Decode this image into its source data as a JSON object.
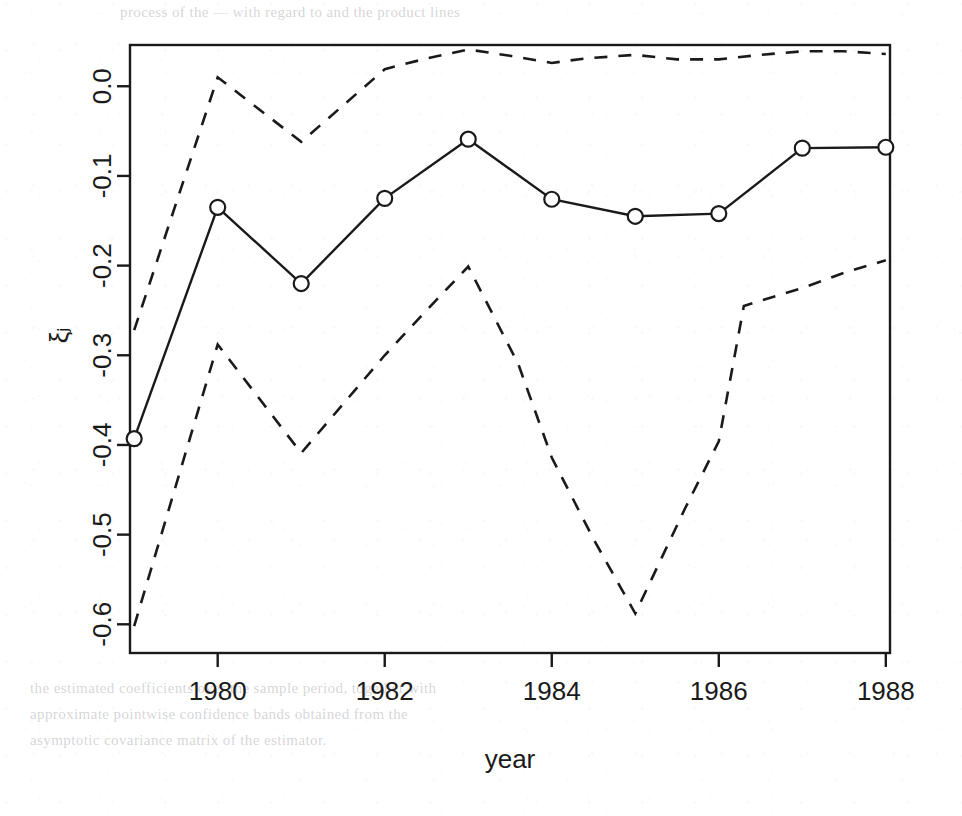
{
  "figure": {
    "background_color": "#ffffff",
    "ink_color": "#1a1a1a",
    "width": 962,
    "height": 816
  },
  "axis": {
    "x_title": "year",
    "y_title": "ξⱼ",
    "x_ticks": [
      "1980",
      "1982",
      "1984",
      "1986",
      "1988"
    ],
    "y_ticks": [
      "0.0",
      "-0.1",
      "-0.2",
      "-0.3",
      "-0.4",
      "-0.5",
      "-0.6"
    ]
  },
  "bleed_through": {
    "top_line": "process of the — with regard to and the product lines",
    "bottom_line_1": "the estimated coefficients over the sample period, together with",
    "bottom_line_2": "approximate pointwise confidence bands obtained from the",
    "bottom_line_3": "asymptotic covariance matrix of the estimator."
  },
  "chart_data": {
    "type": "line",
    "title": "",
    "xlabel": "year",
    "ylabel": "ξⱼ",
    "xlim": [
      1978.95,
      1988.05
    ],
    "ylim": [
      -0.632,
      0.046
    ],
    "grid": false,
    "legend": "none",
    "x": [
      1979,
      1980,
      1981,
      1982,
      1983,
      1984,
      1985,
      1986,
      1987,
      1988
    ],
    "x_tick_values": [
      1980,
      1982,
      1984,
      1986,
      1988
    ],
    "y_tick_values": [
      0.0,
      -0.1,
      -0.2,
      -0.3,
      -0.4,
      -0.5,
      -0.6
    ],
    "series": [
      {
        "name": "estimate",
        "style": "solid",
        "marker": "open-circle",
        "values": [
          -0.393,
          -0.135,
          -0.22,
          -0.125,
          -0.059,
          -0.126,
          -0.145,
          -0.142,
          -0.069,
          -0.068
        ]
      },
      {
        "name": "upper confidence band",
        "style": "dashed",
        "marker": "none",
        "values": [
          -0.272,
          0.01,
          -0.062,
          0.019,
          0.041,
          0.026,
          0.035,
          0.03,
          0.039,
          0.036
        ]
      },
      {
        "name": "lower confidence band",
        "style": "dashed",
        "marker": "none",
        "values": [
          -0.602,
          -0.288,
          -0.409,
          -0.3,
          -0.201,
          -0.414,
          -0.588,
          -0.396,
          -0.225,
          -0.194
        ]
      }
    ],
    "upper_band_dense_x": [
      1979,
      1980,
      1981,
      1982,
      1982.5,
      1983,
      1983.5,
      1984,
      1984.4,
      1985,
      1985.5,
      1986,
      1986.5,
      1987,
      1987.5,
      1988
    ],
    "upper_band_dense_y": [
      -0.272,
      0.01,
      -0.062,
      0.019,
      0.031,
      0.041,
      0.034,
      0.026,
      0.031,
      0.035,
      0.03,
      0.03,
      0.035,
      0.039,
      0.039,
      0.036
    ],
    "lower_band_dense_x": [
      1979,
      1980,
      1981,
      1982,
      1982.5,
      1983,
      1983.6,
      1984,
      1984.5,
      1985,
      1985.6,
      1986,
      1986.3,
      1987,
      1987.5,
      1988
    ],
    "lower_band_dense_y": [
      -0.602,
      -0.288,
      -0.409,
      -0.3,
      -0.25,
      -0.201,
      -0.31,
      -0.414,
      -0.505,
      -0.588,
      -0.47,
      -0.396,
      -0.245,
      -0.225,
      -0.208,
      -0.194
    ]
  }
}
